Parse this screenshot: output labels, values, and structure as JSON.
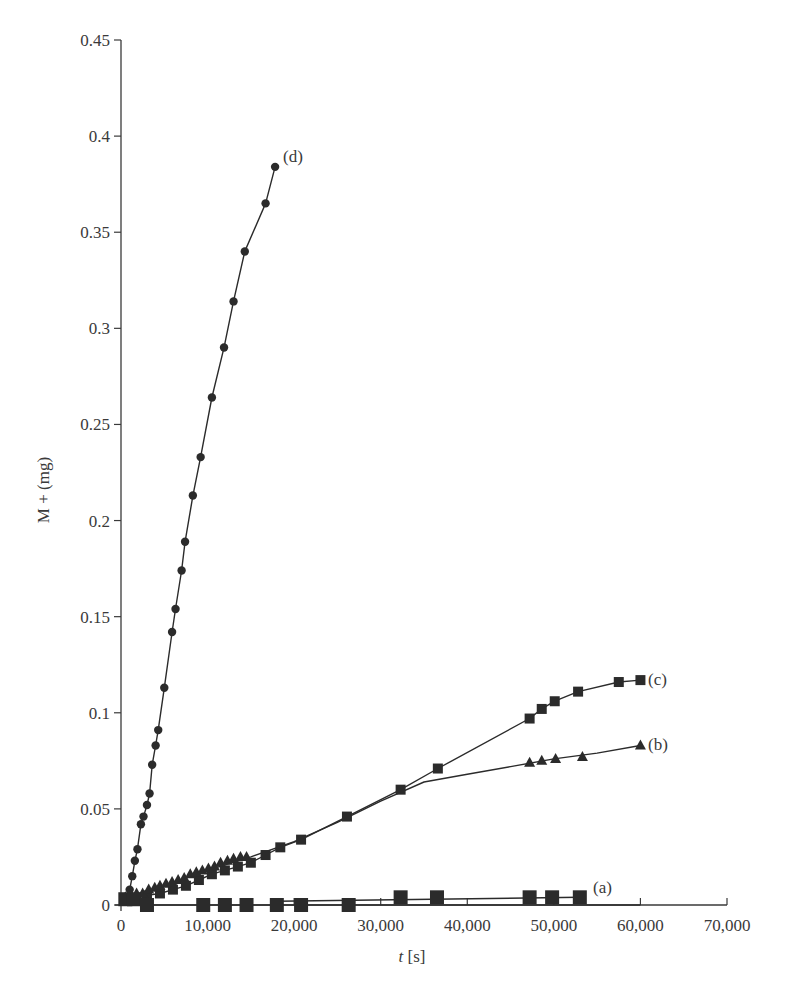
{
  "chart_data": {
    "type": "line",
    "title": "",
    "xlabel": "t [s]",
    "xlabel_italic_part": "t",
    "xlabel_unit_part": " [s]",
    "ylabel": "M + (mg)",
    "xlim": [
      0,
      70000
    ],
    "ylim": [
      0,
      0.45
    ],
    "grid": false,
    "legend": "inline labels at series ends",
    "x_ticks": [
      0,
      10000,
      20000,
      30000,
      40000,
      50000,
      60000,
      70000
    ],
    "x_tick_labels": [
      "0",
      "10,000",
      "20,000",
      "30,000",
      "40,000",
      "50,000",
      "60,000",
      "70,000"
    ],
    "y_ticks": [
      0,
      0.05,
      0.1,
      0.15,
      0.2,
      0.25,
      0.3,
      0.35,
      0.4,
      0.45
    ],
    "y_tick_labels": [
      "0",
      "0.05",
      "0.1",
      "0.15",
      "0.2",
      "0.25",
      "0.3",
      "0.35",
      "0.4",
      "0.45"
    ],
    "series": [
      {
        "name": "(a)",
        "marker": "square-large",
        "points": [
          [
            500,
            0.003
          ],
          [
            1500,
            0.003
          ],
          [
            3000,
            0.0
          ],
          [
            9500,
            0.0
          ],
          [
            12000,
            0.0
          ],
          [
            14500,
            0.0
          ],
          [
            18000,
            0.0
          ],
          [
            20800,
            0.0
          ],
          [
            26300,
            0.0
          ],
          [
            32300,
            0.004
          ],
          [
            36500,
            0.004
          ],
          [
            47200,
            0.004
          ],
          [
            49800,
            0.004
          ],
          [
            53000,
            0.004
          ]
        ],
        "fit_lines": [
          [
            [
              3000,
              0.0
            ],
            [
              60000,
              0.0
            ]
          ],
          [
            [
              18000,
              0.002
            ],
            [
              53000,
              0.004
            ]
          ]
        ]
      },
      {
        "name": "(b)",
        "marker": "triangle",
        "points": [
          [
            500,
            0.004
          ],
          [
            1200,
            0.005
          ],
          [
            1800,
            0.006
          ],
          [
            2500,
            0.006
          ],
          [
            3200,
            0.008
          ],
          [
            3900,
            0.009
          ],
          [
            4500,
            0.01
          ],
          [
            5200,
            0.011
          ],
          [
            5900,
            0.012
          ],
          [
            6600,
            0.013
          ],
          [
            7300,
            0.014
          ],
          [
            8000,
            0.016
          ],
          [
            8700,
            0.017
          ],
          [
            9400,
            0.018
          ],
          [
            10100,
            0.019
          ],
          [
            10800,
            0.02
          ],
          [
            11500,
            0.022
          ],
          [
            12300,
            0.023
          ],
          [
            13000,
            0.024
          ],
          [
            13800,
            0.025
          ],
          [
            14500,
            0.025
          ],
          [
            47200,
            0.074
          ],
          [
            48600,
            0.075
          ],
          [
            50200,
            0.076
          ],
          [
            53300,
            0.077
          ],
          [
            60000,
            0.083
          ]
        ],
        "curve": [
          [
            0,
            0.003
          ],
          [
            5000,
            0.01
          ],
          [
            10000,
            0.018
          ],
          [
            15000,
            0.025
          ],
          [
            20000,
            0.033
          ],
          [
            25000,
            0.043
          ],
          [
            30000,
            0.054
          ],
          [
            35000,
            0.064
          ],
          [
            40000,
            0.068
          ],
          [
            45000,
            0.072
          ],
          [
            50000,
            0.076
          ],
          [
            55000,
            0.079
          ],
          [
            60000,
            0.083
          ]
        ]
      },
      {
        "name": "(c)",
        "marker": "square",
        "points": [
          [
            500,
            0.003
          ],
          [
            1500,
            0.003
          ],
          [
            3000,
            0.005
          ],
          [
            4500,
            0.006
          ],
          [
            6000,
            0.008
          ],
          [
            7500,
            0.01
          ],
          [
            9000,
            0.013
          ],
          [
            10500,
            0.016
          ],
          [
            12000,
            0.018
          ],
          [
            13500,
            0.02
          ],
          [
            15000,
            0.022
          ],
          [
            16700,
            0.026
          ],
          [
            18400,
            0.03
          ],
          [
            20800,
            0.034
          ],
          [
            26100,
            0.046
          ],
          [
            32300,
            0.06
          ],
          [
            36600,
            0.071
          ],
          [
            47200,
            0.097
          ],
          [
            48600,
            0.102
          ],
          [
            50100,
            0.106
          ],
          [
            52800,
            0.111
          ],
          [
            57500,
            0.116
          ],
          [
            60000,
            0.117
          ]
        ]
      },
      {
        "name": "(d)",
        "marker": "circle",
        "points": [
          [
            1000,
            0.008
          ],
          [
            1300,
            0.015
          ],
          [
            1600,
            0.023
          ],
          [
            1900,
            0.029
          ],
          [
            2300,
            0.042
          ],
          [
            2600,
            0.046
          ],
          [
            3000,
            0.052
          ],
          [
            3300,
            0.058
          ],
          [
            3600,
            0.073
          ],
          [
            4000,
            0.083
          ],
          [
            4300,
            0.091
          ],
          [
            5000,
            0.113
          ],
          [
            5900,
            0.142
          ],
          [
            6300,
            0.154
          ],
          [
            7000,
            0.174
          ],
          [
            7400,
            0.189
          ],
          [
            8300,
            0.213
          ],
          [
            9200,
            0.233
          ],
          [
            10500,
            0.264
          ],
          [
            11900,
            0.29
          ],
          [
            13000,
            0.314
          ],
          [
            14300,
            0.34
          ],
          [
            16700,
            0.365
          ],
          [
            17800,
            0.384
          ]
        ]
      }
    ]
  },
  "labels": {
    "ylabel": "M + (mg)",
    "xlabel_var": "t",
    "xlabel_unit": " [s]",
    "series_a": "(a)",
    "series_b": "(b)",
    "series_c": "(c)",
    "series_d": "(d)"
  },
  "colors": {
    "ink": "#2b2b2b",
    "axis": "#3a3a3a",
    "background": "#ffffff"
  }
}
